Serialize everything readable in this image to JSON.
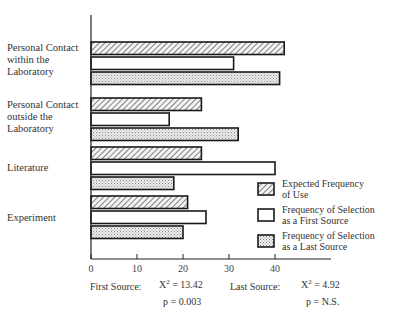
{
  "chart_data": {
    "type": "bar",
    "orientation": "horizontal",
    "title": "",
    "xlabel": "",
    "ylabel": "",
    "xlim": [
      0,
      45
    ],
    "x_ticks": [
      0,
      10,
      20,
      30,
      40
    ],
    "grid": false,
    "legend_position": "lower right",
    "categories": [
      "Personal Contact within the Laboratory",
      "Personal Contact outside the Laboratory",
      "Literature",
      "Experiment"
    ],
    "series": [
      {
        "name": "Expected Frequency of Use",
        "pattern": "diagonal-hatch",
        "values": [
          42,
          24,
          24,
          21
        ]
      },
      {
        "name": "Frequency of Selection as a First Source",
        "pattern": "white",
        "values": [
          31,
          17,
          40,
          25
        ]
      },
      {
        "name": "Frequency of Selection as a Last Source",
        "pattern": "stipple",
        "values": [
          41,
          32,
          18,
          20
        ]
      }
    ],
    "annotations": [
      {
        "label": "First Source:",
        "chi_square": "χ² = 13.42",
        "p": "p = 0.003"
      },
      {
        "label": "Last Source:",
        "chi_square": "χ² = 4.92",
        "p": "p = N.S."
      }
    ]
  },
  "labels": {
    "cat0": [
      "Personal Contact",
      "within the",
      "Laboratory"
    ],
    "cat1": [
      "Personal Contact",
      "outside the",
      "Laboratory"
    ],
    "cat2": [
      "Literature"
    ],
    "cat3": [
      "Experiment"
    ]
  },
  "legend": [
    {
      "line1": "Expected Frequency",
      "line2": "of Use"
    },
    {
      "line1": "Frequency of Selection",
      "line2": "as a First Source"
    },
    {
      "line1": "Frequency of Selection",
      "line2": "as a Last Source"
    }
  ],
  "stats": {
    "first": {
      "label": "First Source:",
      "chi": "X",
      "chi_sup": "2",
      "chi_val": " = 13.42",
      "p": "p = 0.003"
    },
    "last": {
      "label": "Last Source:",
      "chi": "X",
      "chi_sup": "2",
      "chi_val": " = 4.92",
      "p": "p = N.S."
    }
  },
  "colors": {
    "ink": "#1a1a1a",
    "stipple": "#d9d9d9",
    "background": "#ffffff"
  }
}
